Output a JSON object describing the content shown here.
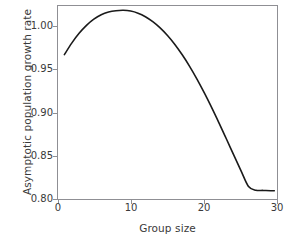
{
  "chart_data": {
    "type": "line",
    "title": "",
    "xlabel": "Group size",
    "ylabel": "Asymptotic population growth rate",
    "xlim": [
      0,
      30
    ],
    "ylim": [
      0.8,
      1.02
    ],
    "xticks": [
      "0",
      "10",
      "20",
      "30"
    ],
    "xtick_values": [
      0,
      10,
      20,
      30
    ],
    "yticks": [
      "0.80",
      "0.85",
      "0.90",
      "0.95",
      "1.00"
    ],
    "ytick_values": [
      0.8,
      0.85,
      0.9,
      0.95,
      1.0
    ],
    "grid": false,
    "legend": null,
    "line_color": "#1a1a1a",
    "frame_color": "#8f8f94",
    "background": "#ffffff",
    "series": [
      {
        "name": "Asymptotic population growth rate",
        "x": [
          1,
          2,
          3,
          4,
          5,
          6,
          7,
          8,
          9,
          10,
          11,
          12,
          13,
          14,
          15,
          16,
          17,
          18,
          19,
          20,
          21,
          22,
          23,
          24,
          25,
          26,
          27,
          28,
          29,
          29.5
        ],
        "values": [
          0.964,
          0.977,
          0.988,
          0.997,
          1.004,
          1.009,
          1.012,
          1.0135,
          1.014,
          1.0132,
          1.0108,
          1.0068,
          1.0012,
          0.9942,
          0.9856,
          0.9755,
          0.9638,
          0.9508,
          0.9364,
          0.9208,
          0.9042,
          0.8868,
          0.8688,
          0.8506,
          0.8326,
          0.8152,
          0.811,
          0.8108,
          0.8105,
          0.8104
        ]
      }
    ],
    "peak": {
      "x": 9,
      "y": 1.014
    },
    "start_point": {
      "x": 1,
      "y": 0.964
    },
    "end_point": {
      "x": 29.5,
      "y": 0.81
    }
  }
}
